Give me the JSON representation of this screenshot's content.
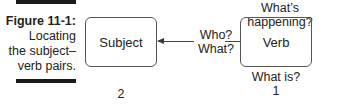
{
  "figure": {
    "label": "Figure 11-1:",
    "caption_lines": [
      "Locating",
      "the subject–",
      "verb pairs."
    ]
  },
  "diagram": {
    "boxes": {
      "subject": "Subject",
      "verb": "Verb"
    },
    "questions": {
      "who_what_line1": "Who?",
      "who_what_line2": "What?",
      "whats_happening": "What’s happening?",
      "what_is": "What is?"
    },
    "step_numbers": {
      "subject": "2",
      "verb": "1"
    }
  }
}
